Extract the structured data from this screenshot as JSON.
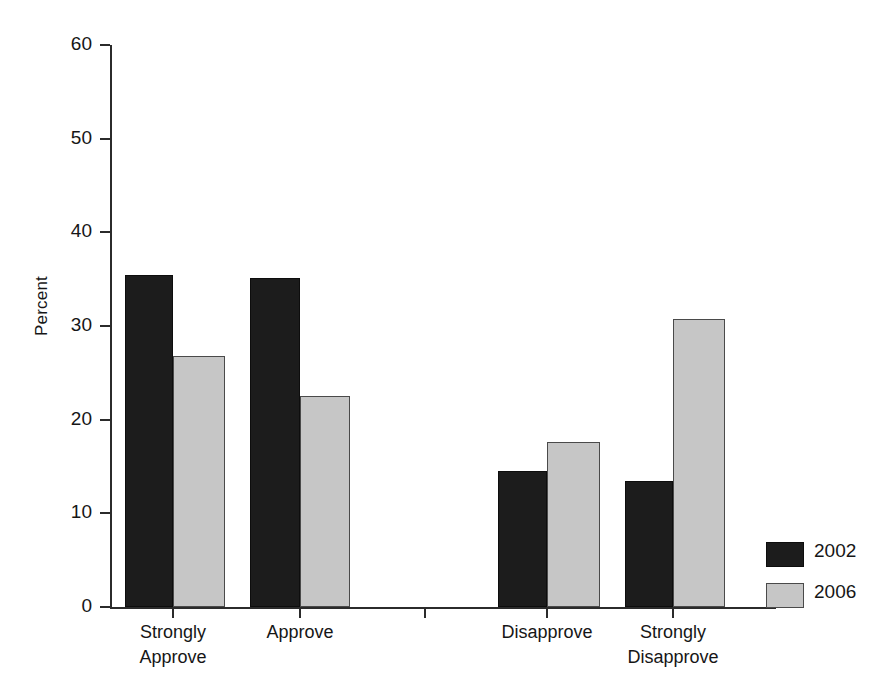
{
  "chart_data": {
    "type": "bar",
    "title": "",
    "xlabel": "",
    "ylabel": "Percent",
    "ylim": [
      0,
      60
    ],
    "yticks": [
      0,
      10,
      20,
      30,
      40,
      50,
      60
    ],
    "ytick_labels": [
      "0",
      "10",
      "20",
      "30",
      "40",
      "50",
      "60"
    ],
    "grid": false,
    "legend_position": "bottom-right",
    "categories": [
      "Strongly Approve",
      "Approve",
      "Disapprove",
      "Strongly Disapprove"
    ],
    "category_label_lines": [
      [
        "Strongly",
        "Approve"
      ],
      [
        "Approve"
      ],
      [
        "Disapprove"
      ],
      [
        "Strongly",
        "Disapprove"
      ]
    ],
    "series": [
      {
        "name": "2002",
        "color": "#1c1c1c",
        "values": [
          35.4,
          35.1,
          14.5,
          13.5
        ]
      },
      {
        "name": "2006",
        "color": "#c6c6c6",
        "values": [
          26.8,
          22.5,
          17.6,
          30.8
        ]
      }
    ]
  },
  "legend": {
    "items": [
      {
        "label": "2002",
        "color": "#1c1c1c"
      },
      {
        "label": "2006",
        "color": "#c6c6c6"
      }
    ]
  },
  "axis": {
    "y_title": "Percent"
  },
  "colors": {
    "series_2002": "#1c1c1c",
    "series_2006": "#c6c6c6",
    "axis": "#2b2b2b",
    "text": "#161616",
    "background": "#ffffff"
  }
}
